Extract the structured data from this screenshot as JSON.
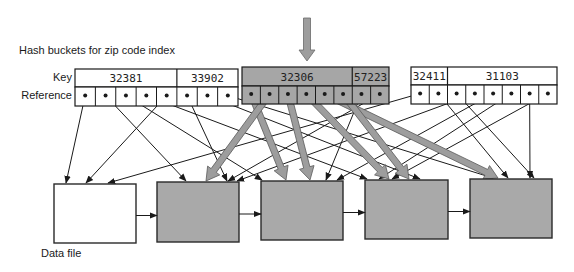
{
  "title": "Hash buckets for zip code index",
  "row_labels": {
    "key": "Key",
    "reference": "Reference"
  },
  "data_file_label": "Data file",
  "colors": {
    "ink": "#1a1a1a",
    "highlight_fill": "#a6a6a6",
    "highlight_arrow": "#9d9d9d",
    "block_fill": "#a9a9a9",
    "white": "#ffffff"
  },
  "query_arrow": {
    "x": 307,
    "y_top": 18,
    "y_tip": 61
  },
  "buckets": [
    {
      "id": "bucket-1",
      "highlighted": false,
      "x": 75,
      "y": 69,
      "w": 163,
      "key_h": 18,
      "ref_h": 19,
      "keys": [
        {
          "value": "32381",
          "cells": 5
        },
        {
          "value": "33902",
          "cells": 3
        }
      ]
    },
    {
      "id": "bucket-2",
      "highlighted": true,
      "x": 242,
      "y": 67,
      "w": 147,
      "key_h": 19,
      "ref_h": 18,
      "keys": [
        {
          "value": "32306",
          "cells": 6
        },
        {
          "value": "57223",
          "cells": 2
        }
      ]
    },
    {
      "id": "bucket-3",
      "highlighted": false,
      "x": 411,
      "y": 67,
      "w": 146,
      "key_h": 18,
      "ref_h": 19,
      "keys": [
        {
          "value": "32411",
          "cells": 2
        },
        {
          "value": "31103",
          "cells": 6
        }
      ]
    }
  ],
  "blocks": [
    {
      "id": "block-1",
      "x": 54,
      "y": 184,
      "w": 82,
      "h": 59,
      "filled": false
    },
    {
      "id": "block-2",
      "x": 157,
      "y": 182,
      "w": 82,
      "h": 60,
      "filled": true
    },
    {
      "id": "block-3",
      "x": 261,
      "y": 181,
      "w": 82,
      "h": 59,
      "filled": true
    },
    {
      "id": "block-4",
      "x": 365,
      "y": 180,
      "w": 83,
      "h": 59,
      "filled": true
    },
    {
      "id": "block-5",
      "x": 470,
      "y": 179,
      "w": 82,
      "h": 59,
      "filled": true
    }
  ],
  "references": [
    {
      "bucket": 0,
      "cell": 0,
      "to": [
        66,
        183
      ],
      "thick": false
    },
    {
      "bucket": 0,
      "cell": 1,
      "to": [
        186,
        181
      ],
      "thick": false
    },
    {
      "bucket": 0,
      "cell": 2,
      "to": [
        262,
        180
      ],
      "thick": false
    },
    {
      "bucket": 0,
      "cell": 3,
      "to": [
        367,
        179
      ],
      "thick": false
    },
    {
      "bucket": 0,
      "cell": 4,
      "to": [
        86,
        183
      ],
      "thick": false
    },
    {
      "bucket": 0,
      "cell": 5,
      "to": [
        227,
        181
      ],
      "thick": false
    },
    {
      "bucket": 0,
      "cell": 6,
      "to": [
        420,
        179
      ],
      "thick": false
    },
    {
      "bucket": 0,
      "cell": 7,
      "to": [
        493,
        178
      ],
      "thick": false
    },
    {
      "bucket": 1,
      "cell": 0,
      "to": [
        286,
        180
      ],
      "thick": true
    },
    {
      "bucket": 1,
      "cell": 1,
      "to": [
        206,
        181
      ],
      "thick": true
    },
    {
      "bucket": 1,
      "cell": 2,
      "to": [
        310,
        180
      ],
      "thick": true
    },
    {
      "bucket": 1,
      "cell": 3,
      "to": [
        389,
        179
      ],
      "thick": true
    },
    {
      "bucket": 1,
      "cell": 4,
      "to": [
        498,
        178
      ],
      "thick": true
    },
    {
      "bucket": 1,
      "cell": 5,
      "to": [
        409,
        179
      ],
      "thick": true
    },
    {
      "bucket": 1,
      "cell": 6,
      "to": [
        326,
        180
      ],
      "thick": false
    },
    {
      "bucket": 1,
      "cell": 7,
      "to": [
        228,
        181
      ],
      "thick": false
    },
    {
      "bucket": 2,
      "cell": 0,
      "to": [
        108,
        183
      ],
      "thick": false
    },
    {
      "bucket": 2,
      "cell": 1,
      "to": [
        508,
        178
      ],
      "thick": false
    },
    {
      "bucket": 2,
      "cell": 2,
      "to": [
        534,
        178
      ],
      "thick": false
    },
    {
      "bucket": 2,
      "cell": 3,
      "to": [
        237,
        181
      ],
      "thick": false
    },
    {
      "bucket": 2,
      "cell": 4,
      "to": [
        337,
        180
      ],
      "thick": false
    },
    {
      "bucket": 2,
      "cell": 5,
      "to": [
        379,
        179
      ],
      "thick": false
    },
    {
      "bucket": 2,
      "cell": 6,
      "to": [
        530,
        178
      ],
      "thick": false
    },
    {
      "bucket": 2,
      "cell": 7,
      "to": [
        392,
        179
      ],
      "thick": false
    }
  ],
  "chain": [
    {
      "from": 0,
      "to": 1
    },
    {
      "from": 1,
      "to": 2
    },
    {
      "from": 2,
      "to": 3
    },
    {
      "from": 3,
      "to": 4
    }
  ]
}
